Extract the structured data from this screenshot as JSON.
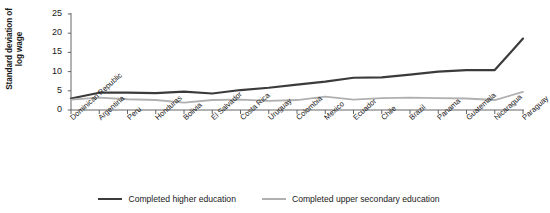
{
  "chart_data": {
    "type": "line",
    "title": "",
    "xlabel": "",
    "ylabel": "Standard deviation of log wage",
    "ylabel_lines": [
      "Standard deviation of",
      "log wage"
    ],
    "ylim": [
      0,
      25
    ],
    "yticks": [
      0,
      5,
      10,
      15,
      20,
      25
    ],
    "ytick_labels": [
      "0",
      "5",
      "10",
      "15",
      "20",
      "25"
    ],
    "grid": false,
    "legend_position": "bottom",
    "categories": [
      "Dominican Republic",
      "Argentina",
      "Peru",
      "Honduras",
      "Bolivia",
      "El Salvador",
      "Costa Rica",
      "Uruguay",
      "Colombia",
      "Mexico",
      "Ecuador",
      "Chile",
      "Brazil",
      "Panama",
      "Guatemala",
      "Nicaragua",
      "Paraguay"
    ],
    "series": [
      {
        "name": "Completed higher education",
        "color": "#3b3b3b",
        "values": [
          3.0,
          4.5,
          4.5,
          4.4,
          4.8,
          4.3,
          5.2,
          5.8,
          6.6,
          7.4,
          8.4,
          8.5,
          9.2,
          10.0,
          10.4,
          10.4,
          18.6
        ]
      },
      {
        "name": "Completed upper secondary education",
        "color": "#b0b0b0",
        "values": [
          2.7,
          3.2,
          2.8,
          2.6,
          1.9,
          2.6,
          2.7,
          2.4,
          2.6,
          3.5,
          2.7,
          3.1,
          3.2,
          3.1,
          3.0,
          2.6,
          4.7
        ]
      }
    ]
  },
  "legend": {
    "items": [
      {
        "label": "Completed higher education"
      },
      {
        "label": "Completed upper secondary education"
      }
    ]
  }
}
